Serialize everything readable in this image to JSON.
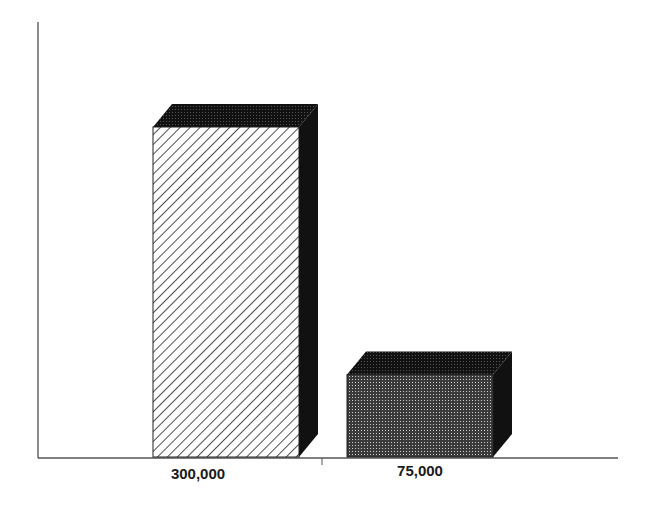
{
  "chart_data": {
    "type": "bar",
    "style": "3d",
    "title": "",
    "xlabel": "",
    "ylabel": "",
    "categories": [
      "300,000",
      "75,000"
    ],
    "values": [
      300000,
      75000
    ],
    "ylim": [
      0,
      400000
    ],
    "grid": false,
    "legend": null,
    "bar_patterns": [
      "diagonal-hatch",
      "dot-screen"
    ],
    "colors": {
      "axis": "#555555",
      "side_face": "#111111",
      "dot_fill": "#444444",
      "hatch": "#222222",
      "background": "#ffffff"
    }
  }
}
